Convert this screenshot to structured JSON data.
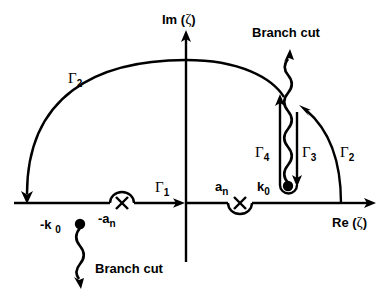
{
  "figure": {
    "type": "complex-plane-contour-diagram",
    "background_color": "#ffffff",
    "stroke_color": "#000000",
    "width": 389,
    "height": 291
  },
  "axes": {
    "imaginary": {
      "label_prefix": "Im (",
      "label_symbol": "ζ",
      "label_suffix": ")",
      "label_full": "Im ( ζ )",
      "direction": "up"
    },
    "real": {
      "label_prefix": "Re (",
      "label_symbol": "ζ",
      "label_suffix": ")",
      "label_full": "Re ( ζ )",
      "direction": "right"
    },
    "origin_x": 186,
    "origin_y": 203
  },
  "contours": [
    {
      "id": "gamma1",
      "name": "Γ",
      "subscript": "1",
      "description": "real-axis segment with rightward arrow left of origin"
    },
    {
      "id": "gamma2-left",
      "name": "Γ",
      "subscript": "2",
      "description": "large semicircular arc upper-left, arrow down onto real axis"
    },
    {
      "id": "gamma2-right",
      "name": "Γ",
      "subscript": "2",
      "description": "arc segment on the right descending to real axis"
    },
    {
      "id": "gamma3",
      "name": "Γ",
      "subscript": "3",
      "description": "right side of keyhole, arrow pointing down to k0"
    },
    {
      "id": "gamma4",
      "name": "Γ",
      "subscript": "4",
      "description": "left side of keyhole, arrow pointing up"
    }
  ],
  "poles": [
    {
      "id": "minus-k0",
      "label_main": "-k",
      "label_sub": "0",
      "marker": "filled-dot",
      "x": 80,
      "y": 224
    },
    {
      "id": "minus-an",
      "label_main": "-a",
      "label_sub": "n",
      "marker": "cross",
      "x": 122,
      "y": 203
    },
    {
      "id": "an",
      "label_main": "a",
      "label_sub": "n",
      "marker": "cross",
      "x": 240,
      "y": 203
    },
    {
      "id": "k0",
      "label_main": "k",
      "label_sub": "0",
      "marker": "filled-dot",
      "x": 287,
      "y": 187
    }
  ],
  "branch_cuts": [
    {
      "id": "branch-cut-upper",
      "label": "Branch cut",
      "label_x": 274,
      "label_y": 32,
      "direction": "up-from-k0",
      "style": "wavy-line-with-arrow"
    },
    {
      "id": "branch-cut-lower",
      "label": "Branch cut",
      "label_x": 96,
      "label_y": 268,
      "direction": "down-from-minus-k0",
      "style": "wavy-line-with-arrow"
    }
  ]
}
